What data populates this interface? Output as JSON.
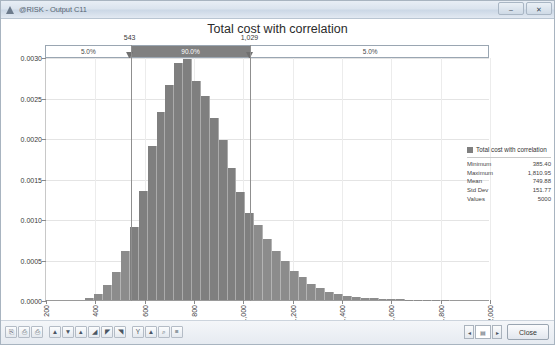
{
  "window": {
    "title": "@RISK - Output C11",
    "app_icon": "risk-triangle-icon",
    "minimize_label": "–",
    "maximize_label": "❐",
    "close_label": "✕"
  },
  "legend": {
    "series_name": "Total cost with correlation",
    "stats": [
      {
        "key": "Minimum",
        "value": "385.40"
      },
      {
        "key": "Maximum",
        "value": "1,810.95"
      },
      {
        "key": "Mean",
        "value": "749.88"
      },
      {
        "key": "Std Dev",
        "value": "151.77"
      },
      {
        "key": "Values",
        "value": "5000"
      }
    ]
  },
  "delimiters": {
    "left_label": "543",
    "right_label": "1,029",
    "left_value": 543,
    "right_value": 1029,
    "segments": [
      {
        "label": "5.0%",
        "kind": "outer-left"
      },
      {
        "label": "90.0%",
        "kind": "inner"
      },
      {
        "label": "5.0%",
        "kind": "outer-right"
      }
    ]
  },
  "toolbar": {
    "icons": [
      "copy-icon",
      "paste-icon",
      "print-icon",
      "bar-chart-icon",
      "cumulative-descending-icon",
      "cumulative-ascending-icon",
      "area-chart-icon",
      "scatter-icon",
      "line-chart-icon",
      "summary-icon",
      "overlay-icon",
      "zoom-icon",
      "settings-icon"
    ],
    "icon_glyphs": [
      "⎘",
      "⎙",
      "⎙",
      "▲",
      "▼",
      "▴",
      "◢",
      "◤",
      "◥",
      "Υ",
      "▲",
      "⌕",
      "≡"
    ],
    "nav_prev": "◂",
    "nav_next": "▸",
    "nav_page": "▤",
    "close_button": "Close"
  },
  "chart_data": {
    "type": "bar",
    "title": "Total cost with correlation",
    "xlabel": "",
    "ylabel": "",
    "grid": true,
    "legend_position": "right",
    "xlim": [
      200,
      2000
    ],
    "ylim": [
      0.0,
      0.003
    ],
    "xticks": [
      "200",
      "400",
      "600",
      "800",
      "1,000",
      "1,200",
      "1,400",
      "1,600",
      "1,800",
      "2,000"
    ],
    "xtick_values": [
      200,
      400,
      600,
      800,
      1000,
      1200,
      1400,
      1600,
      1800,
      2000
    ],
    "yticks": [
      "0.0000",
      "0.0005",
      "0.0010",
      "0.0015",
      "0.0020",
      "0.0025",
      "0.0030"
    ],
    "ytick_values": [
      0.0,
      0.0005,
      0.001,
      0.0015,
      0.002,
      0.0025,
      0.003
    ],
    "series_name": "Total cost with correlation",
    "bar_color": "#7f7f7f",
    "bin_width": 36,
    "x": [
      378,
      414,
      450,
      486,
      522,
      558,
      594,
      630,
      666,
      702,
      738,
      774,
      810,
      846,
      882,
      918,
      954,
      990,
      1026,
      1062,
      1098,
      1134,
      1170,
      1206,
      1242,
      1278,
      1314,
      1350,
      1386,
      1422,
      1458,
      1494,
      1530,
      1566,
      1602,
      1638,
      1674,
      1710,
      1746,
      1782,
      1818
    ],
    "values": [
      2e-05,
      8e-05,
      0.00018,
      0.00035,
      0.0006,
      0.0009,
      0.00135,
      0.0019,
      0.00232,
      0.00265,
      0.00292,
      0.00297,
      0.0027,
      0.00252,
      0.00225,
      0.00198,
      0.00163,
      0.00133,
      0.00108,
      0.00092,
      0.00075,
      0.0006,
      0.00048,
      0.00036,
      0.00028,
      0.0002,
      0.00015,
      0.0001,
      7e-05,
      5e-05,
      4e-05,
      3e-05,
      2e-05,
      1.5e-05,
      1e-05,
      8e-06,
      6e-06,
      5e-06,
      4e-06,
      3e-06,
      2e-06
    ]
  }
}
